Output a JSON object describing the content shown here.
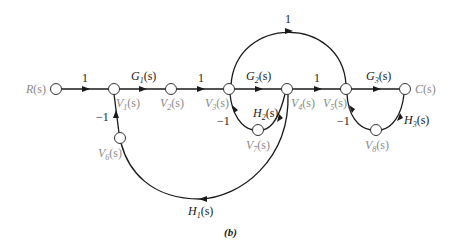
{
  "diagram": {
    "type": "signal-flow-graph",
    "caption": "(b)",
    "nodes": {
      "R": "R(s)",
      "V1": "V1(s)",
      "V2": "V2(s)",
      "V3": "V3(s)",
      "V4": "V4(s)",
      "V5": "V5(s)",
      "C": "C(s)",
      "V6": "V6(s)",
      "V7": "V7(s)",
      "V8": "V8(s)"
    },
    "branches": [
      {
        "from": "R(s)",
        "to": "V1(s)",
        "gain": "1"
      },
      {
        "from": "V1(s)",
        "to": "V2(s)",
        "gain": "G1(s)"
      },
      {
        "from": "V2(s)",
        "to": "V3(s)",
        "gain": "1"
      },
      {
        "from": "V3(s)",
        "to": "V4(s)",
        "gain": "G2(s)"
      },
      {
        "from": "V4(s)",
        "to": "V5(s)",
        "gain": "1"
      },
      {
        "from": "V5(s)",
        "to": "C(s)",
        "gain": "G3(s)"
      },
      {
        "from": "V3(s)",
        "to": "V5(s)",
        "gain": "1"
      },
      {
        "from": "V4(s)",
        "to": "V7(s)",
        "gain": "H2(s)"
      },
      {
        "from": "V7(s)",
        "to": "V3(s)",
        "gain": "-1"
      },
      {
        "from": "C(s)",
        "to": "V8(s)",
        "gain": "H3(s)"
      },
      {
        "from": "V8(s)",
        "to": "V5(s)",
        "gain": "-1"
      },
      {
        "from": "V4(s)",
        "to": "V6(s)",
        "gain": "H1(s)"
      },
      {
        "from": "V6(s)",
        "to": "V1(s)",
        "gain": "-1"
      }
    ],
    "gains": {
      "r_v1": "1",
      "g1": "G",
      "g1_sub": "1",
      "v2_v3": "1",
      "g2": "G",
      "g2_sub": "2",
      "v4_v5": "1",
      "g3": "G",
      "g3_sub": "3",
      "feedforward": "1",
      "h2": "H",
      "h2_sub": "2",
      "h3": "H",
      "h3_sub": "3",
      "h1": "H",
      "h1_sub": "1",
      "neg_v1": "−1",
      "neg_v3": "−1",
      "neg_v5": "−1"
    },
    "node_labels": {
      "r": "R",
      "c": "C",
      "v": "V",
      "s": "(s)",
      "v1_sub": "1",
      "v2_sub": "2",
      "v3_sub": "3",
      "v4_sub": "4",
      "v5_sub": "5",
      "v6_sub": "6",
      "v7_sub": "7",
      "v8_sub": "8"
    }
  }
}
